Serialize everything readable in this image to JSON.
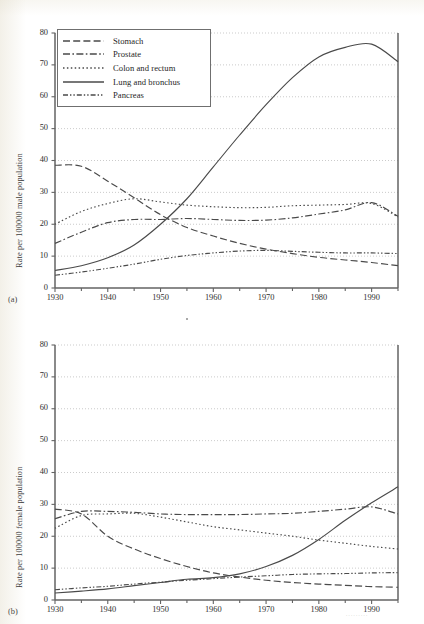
{
  "figure_a": {
    "panel_letter": "(a)",
    "ylabel": "Rate per 100000 male population",
    "y_ticks": [
      "0",
      "10",
      "20",
      "30",
      "40",
      "50",
      "60",
      "70",
      "80"
    ],
    "x_ticks": [
      "1930",
      "1940",
      "1950",
      "1960",
      "1970",
      "1980",
      "1990"
    ],
    "legend": [
      {
        "label": "Stomach",
        "style": "dashed"
      },
      {
        "label": "Prostate",
        "style": "dash-dot"
      },
      {
        "label": "Colon and rectum",
        "style": "dotted"
      },
      {
        "label": "Lung and bronchus",
        "style": "solid"
      },
      {
        "label": "Pancreas",
        "style": "dash-dot-dot"
      }
    ]
  },
  "figure_b": {
    "panel_letter": "(b)",
    "ylabel": "Rate per 100000 female population",
    "y_ticks": [
      "0",
      "10",
      "20",
      "30",
      "40",
      "50",
      "60",
      "70",
      "80"
    ],
    "x_ticks": [
      "1930",
      "1940",
      "1950",
      "1960",
      "1970",
      "1980",
      "1990"
    ],
    "legend": [
      {
        "label": "Stomach",
        "style": "dashed"
      },
      {
        "label": "Breast",
        "style": "dash-dot"
      },
      {
        "label": "Colon and rectum",
        "style": "dotted"
      },
      {
        "label": "Lung and bronchus",
        "style": "solid"
      },
      {
        "label": "Pancreas",
        "style": "dash-dot-dot"
      }
    ]
  },
  "chart_data": [
    {
      "type": "line",
      "title": "",
      "panel": "(a)",
      "xlabel": "",
      "ylabel": "Rate per 100000 male population",
      "xlim": [
        1930,
        1995
      ],
      "ylim": [
        0,
        80
      ],
      "x_ticks": [
        1930,
        1940,
        1950,
        1960,
        1970,
        1980,
        1990
      ],
      "y_ticks": [
        0,
        10,
        20,
        30,
        40,
        50,
        60,
        70,
        80
      ],
      "grid": "horizontal-dotted",
      "legend_position": "top-left",
      "x": [
        1930,
        1935,
        1940,
        1945,
        1950,
        1955,
        1960,
        1965,
        1970,
        1975,
        1980,
        1985,
        1990,
        1995
      ],
      "series": [
        {
          "name": "Stomach",
          "style": "dashed",
          "values": [
            38.5,
            38.2,
            33.5,
            28.3,
            23.0,
            19.0,
            16.3,
            14.0,
            12.2,
            10.8,
            9.6,
            8.8,
            8.0,
            7.0
          ]
        },
        {
          "name": "Prostate",
          "style": "dash-dot",
          "values": [
            14.0,
            17.5,
            20.5,
            21.5,
            21.5,
            21.8,
            21.5,
            21.2,
            21.3,
            22.0,
            23.2,
            24.5,
            26.8,
            22.5
          ]
        },
        {
          "name": "Colon and rectum",
          "style": "dotted",
          "values": [
            20.0,
            24.0,
            26.5,
            28.0,
            27.0,
            26.0,
            25.5,
            25.2,
            25.3,
            25.8,
            26.0,
            26.2,
            26.5,
            22.3
          ]
        },
        {
          "name": "Lung and bronchus",
          "style": "solid",
          "values": [
            5.5,
            7.0,
            9.5,
            13.5,
            20.0,
            28.0,
            38.0,
            48.0,
            57.5,
            66.0,
            72.5,
            75.5,
            76.5,
            71.0
          ]
        },
        {
          "name": "Pancreas",
          "style": "dash-dot-dot",
          "values": [
            4.0,
            5.0,
            6.2,
            7.5,
            9.0,
            10.2,
            11.0,
            11.6,
            11.8,
            11.5,
            11.2,
            11.0,
            11.0,
            10.8
          ]
        }
      ]
    },
    {
      "type": "line",
      "title": "",
      "panel": "(b)",
      "xlabel": "",
      "ylabel": "Rate per 100000 female population",
      "xlim": [
        1930,
        1995
      ],
      "ylim": [
        0,
        80
      ],
      "x_ticks": [
        1930,
        1940,
        1950,
        1960,
        1970,
        1980,
        1990
      ],
      "y_ticks": [
        0,
        10,
        20,
        30,
        40,
        50,
        60,
        70,
        80
      ],
      "grid": "horizontal-dotted",
      "legend_position": "top-left",
      "x": [
        1930,
        1935,
        1940,
        1945,
        1950,
        1955,
        1960,
        1965,
        1970,
        1975,
        1980,
        1985,
        1990,
        1995
      ],
      "series": [
        {
          "name": "Stomach",
          "style": "dashed",
          "values": [
            28.5,
            27.0,
            20.0,
            16.0,
            13.0,
            10.5,
            8.5,
            7.2,
            6.2,
            5.5,
            5.0,
            4.6,
            4.2,
            4.0
          ]
        },
        {
          "name": "Breast",
          "style": "dash-dot",
          "values": [
            25.5,
            27.8,
            27.8,
            27.5,
            27.0,
            26.8,
            26.8,
            26.8,
            27.0,
            27.2,
            27.8,
            28.5,
            29.2,
            27.0
          ]
        },
        {
          "name": "Colon and rectum",
          "style": "dotted",
          "values": [
            22.5,
            26.5,
            27.0,
            27.2,
            26.0,
            24.5,
            23.0,
            22.0,
            21.0,
            20.0,
            18.8,
            17.8,
            16.8,
            16.0
          ]
        },
        {
          "name": "Lung and bronchus",
          "style": "solid",
          "values": [
            2.2,
            2.8,
            3.5,
            4.5,
            5.5,
            6.5,
            7.0,
            8.2,
            10.5,
            14.0,
            19.0,
            25.0,
            30.5,
            35.5
          ]
        },
        {
          "name": "Pancreas",
          "style": "dash-dot-dot",
          "values": [
            3.2,
            3.8,
            4.3,
            5.0,
            5.6,
            6.2,
            6.7,
            7.2,
            7.6,
            8.0,
            8.2,
            8.3,
            8.5,
            8.6
          ]
        }
      ]
    }
  ]
}
